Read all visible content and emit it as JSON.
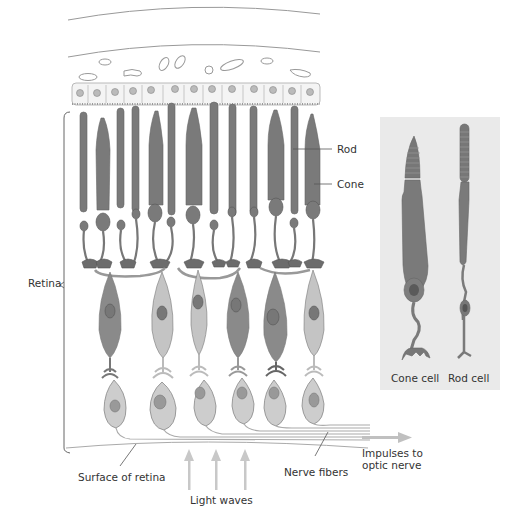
{
  "diagram": {
    "type": "anatomical-illustration",
    "colors": {
      "rod_cone_dark": "#7a7a7a",
      "bipolar_dark": "#8a8a8a",
      "bipolar_light": "#c4c4c4",
      "ganglion": "#cdcdcd",
      "nucleus": "#8f8f8f",
      "inset_bg": "#eaeaea",
      "arrow": "#c8c8c8",
      "line": "#888888",
      "text": "#333333"
    }
  },
  "labels": {
    "rod": "Rod",
    "cone": "Cone",
    "retina": "Retina",
    "surface_of_retina": "Surface of retina",
    "light_waves": "Light waves",
    "nerve_fibers": "Nerve fibers",
    "impulses_line1": "Impulses to",
    "impulses_line2": "optic nerve"
  },
  "inset": {
    "cone_cell_label": "Cone cell",
    "rod_cell_label": "Rod cell"
  }
}
